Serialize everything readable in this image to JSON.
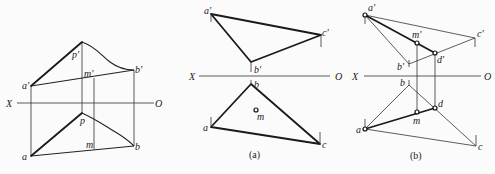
{
  "figure": {
    "left_panel": {
      "axis": {
        "x_label": "X",
        "o_label": "O"
      },
      "labels": {
        "p_prime": "p'",
        "a_prime": "a'",
        "b_prime": "b'",
        "m_prime": "m'",
        "p": "p",
        "a": "a",
        "b": "b",
        "m": "m"
      }
    },
    "panel_a": {
      "caption": "(a)",
      "axis": {
        "x_label": "X",
        "o_label": "O"
      },
      "labels": {
        "a_prime": "a'",
        "b_prime": "b'",
        "c_prime": "c'",
        "a": "a",
        "b": "b",
        "c": "c",
        "m": "m"
      }
    },
    "panel_b": {
      "caption": "(b)",
      "axis": {
        "x_label": "X",
        "o_label": "O"
      },
      "labels": {
        "a_prime": "a'",
        "b_prime": "b'",
        "c_prime": "c'",
        "m_prime": "m'",
        "d_prime": "d'",
        "a": "a",
        "b": "b",
        "c": "c",
        "m": "m",
        "d": "d"
      }
    }
  }
}
